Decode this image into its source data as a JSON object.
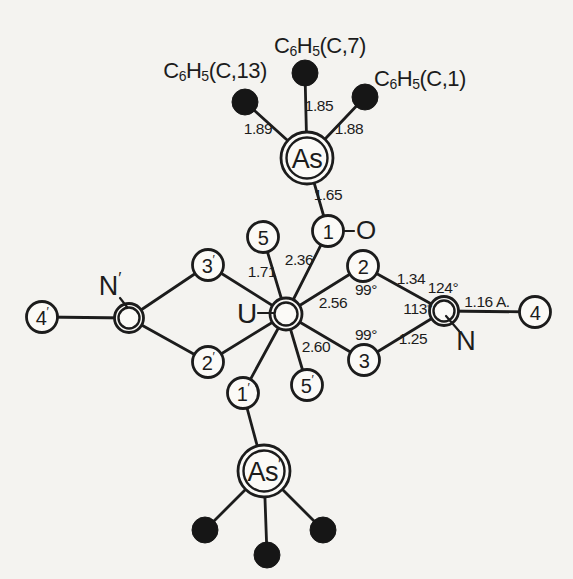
{
  "canvas": {
    "width": 573,
    "height": 579,
    "background": "#f4f3f0",
    "circle_fill": "#fbfaf7",
    "ink": "#1c1c1c"
  },
  "atoms": [
    {
      "id": "As",
      "x": 307,
      "y": 158,
      "style": "double",
      "r": 26,
      "ri": 20.5,
      "label": "As",
      "label_size": 27
    },
    {
      "id": "Asp",
      "x": 264,
      "y": 471,
      "style": "double",
      "r": 26,
      "ri": 20.5,
      "label": "As'",
      "label_size": 27
    },
    {
      "id": "U",
      "x": 286,
      "y": 314,
      "style": "double",
      "r": 16,
      "ri": 11.5,
      "label": ""
    },
    {
      "id": "N",
      "x": 444,
      "y": 311,
      "style": "double",
      "r": 14.5,
      "ri": 10.5,
      "label": ""
    },
    {
      "id": "Np",
      "x": 129,
      "y": 318,
      "style": "double",
      "r": 14.5,
      "ri": 10.5,
      "label": ""
    },
    {
      "id": "1",
      "x": 328,
      "y": 231,
      "style": "open",
      "r": 15.5,
      "label": "1"
    },
    {
      "id": "2",
      "x": 363,
      "y": 266,
      "style": "open",
      "r": 15.5,
      "label": "2"
    },
    {
      "id": "3",
      "x": 364,
      "y": 360,
      "style": "open",
      "r": 15.5,
      "label": "3"
    },
    {
      "id": "4",
      "x": 535,
      "y": 312,
      "style": "open",
      "r": 15.5,
      "label": "4"
    },
    {
      "id": "5",
      "x": 263,
      "y": 237,
      "style": "open",
      "r": 15.5,
      "label": "5"
    },
    {
      "id": "1p",
      "x": 243,
      "y": 393,
      "style": "open",
      "r": 15.5,
      "label": "1'"
    },
    {
      "id": "2p",
      "x": 208,
      "y": 362,
      "style": "open",
      "r": 15.5,
      "label": "2'"
    },
    {
      "id": "3p",
      "x": 208,
      "y": 265,
      "style": "open",
      "r": 15.5,
      "label": "3'"
    },
    {
      "id": "4p",
      "x": 42,
      "y": 317,
      "style": "open",
      "r": 15.5,
      "label": "4'"
    },
    {
      "id": "5p",
      "x": 307,
      "y": 385,
      "style": "open",
      "r": 15.5,
      "label": "5'"
    },
    {
      "id": "C13",
      "x": 245,
      "y": 102,
      "style": "filled",
      "r": 13,
      "label": ""
    },
    {
      "id": "C7",
      "x": 305,
      "y": 73,
      "style": "filled",
      "r": 13,
      "label": ""
    },
    {
      "id": "C1",
      "x": 365,
      "y": 97,
      "style": "filled",
      "r": 13,
      "label": ""
    },
    {
      "id": "B1",
      "x": 205,
      "y": 530,
      "style": "filled",
      "r": 13,
      "label": ""
    },
    {
      "id": "B2",
      "x": 267,
      "y": 555,
      "style": "filled",
      "r": 13,
      "label": ""
    },
    {
      "id": "B3",
      "x": 323,
      "y": 530,
      "style": "filled",
      "r": 13,
      "label": ""
    }
  ],
  "bonds": [
    {
      "from": "As",
      "to": "C13"
    },
    {
      "from": "As",
      "to": "C7"
    },
    {
      "from": "As",
      "to": "C1"
    },
    {
      "from": "As",
      "to": "1"
    },
    {
      "from": "U",
      "to": "5"
    },
    {
      "from": "U",
      "to": "1"
    },
    {
      "from": "U",
      "to": "2"
    },
    {
      "from": "U",
      "to": "3"
    },
    {
      "from": "U",
      "to": "5p"
    },
    {
      "from": "U",
      "to": "1p"
    },
    {
      "from": "U",
      "to": "2p"
    },
    {
      "from": "U",
      "to": "3p"
    },
    {
      "from": "2",
      "to": "N"
    },
    {
      "from": "3",
      "to": "N"
    },
    {
      "from": "N",
      "to": "4"
    },
    {
      "from": "3p",
      "to": "Np"
    },
    {
      "from": "2p",
      "to": "Np"
    },
    {
      "from": "Np",
      "to": "4p"
    },
    {
      "from": "1p",
      "to": "Asp"
    },
    {
      "from": "Asp",
      "to": "B1"
    },
    {
      "from": "Asp",
      "to": "B2"
    },
    {
      "from": "Asp",
      "to": "B3"
    }
  ],
  "distance_labels": [
    {
      "text": "1.89",
      "x": 258,
      "y": 128
    },
    {
      "text": "1.85",
      "x": 319,
      "y": 105
    },
    {
      "text": "1.88",
      "x": 349,
      "y": 128
    },
    {
      "text": "1.65",
      "x": 328,
      "y": 194
    },
    {
      "text": "2.36",
      "x": 299,
      "y": 259
    },
    {
      "text": "1.71",
      "x": 262,
      "y": 271
    },
    {
      "text": "2.56",
      "x": 333,
      "y": 302
    },
    {
      "text": "2.60",
      "x": 316,
      "y": 346
    },
    {
      "text": "1.34",
      "x": 411,
      "y": 278
    },
    {
      "text": "1.25",
      "x": 413,
      "y": 338
    },
    {
      "text": "1.16 A.",
      "x": 487,
      "y": 301
    }
  ],
  "angle_labels": [
    {
      "text": "99°",
      "x": 366,
      "y": 289
    },
    {
      "text": "99°",
      "x": 366,
      "y": 334
    },
    {
      "text": "124°",
      "x": 443,
      "y": 287
    },
    {
      "text": "113°",
      "x": 418,
      "y": 308
    }
  ],
  "element_labels": [
    {
      "text": "U",
      "x": 247,
      "y": 313,
      "size": 28,
      "dash": {
        "x1": 258,
        "y1": 313,
        "x2": 274,
        "y2": 313
      }
    },
    {
      "text": "O",
      "x": 366,
      "y": 230,
      "size": 26,
      "dash": {
        "x1": 344,
        "y1": 231,
        "x2": 354,
        "y2": 231
      }
    },
    {
      "text": "N",
      "x": 466,
      "y": 341,
      "size": 27,
      "leader": {
        "x1": 446,
        "y1": 316,
        "x2": 459,
        "y2": 331
      }
    },
    {
      "text": "N'",
      "x": 110,
      "y": 286,
      "size": 27,
      "leader": {
        "x1": 120,
        "y1": 298,
        "x2": 127,
        "y2": 307
      }
    }
  ],
  "phenyl_labels": [
    {
      "name": "C6H5-C13",
      "x": 215,
      "y": 70,
      "segments": [
        {
          "t": "C"
        },
        {
          "t": "6",
          "sub": true
        },
        {
          "t": "H"
        },
        {
          "t": "5",
          "sub": true
        },
        {
          "t": "(C,13)"
        }
      ]
    },
    {
      "name": "C6H5-C7",
      "x": 320,
      "y": 45,
      "segments": [
        {
          "t": "C"
        },
        {
          "t": "6",
          "sub": true
        },
        {
          "t": "H"
        },
        {
          "t": "5",
          "sub": true
        },
        {
          "t": "(C,7)"
        }
      ]
    },
    {
      "name": "C6H5-C1",
      "x": 420,
      "y": 78,
      "segments": [
        {
          "t": "C"
        },
        {
          "t": "6",
          "sub": true
        },
        {
          "t": "H"
        },
        {
          "t": "5",
          "sub": true
        },
        {
          "t": "(C,1)"
        }
      ]
    }
  ]
}
